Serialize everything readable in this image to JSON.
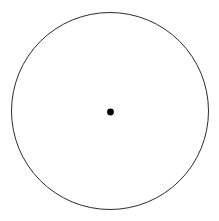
{
  "figure": {
    "title": "Circle with marked center point",
    "canvas": {
      "width": 219,
      "height": 221,
      "background_color": "#ffffff"
    },
    "shapes": {
      "circle_outline": {
        "name": "circle-outline",
        "center_x": 110,
        "center_y": 111,
        "radius": 98.5,
        "stroke_color": "#2b2b2b",
        "stroke_width": 1,
        "fill": "none"
      },
      "center_point": {
        "name": "center-point-dot",
        "center_x": 110.5,
        "center_y": 112,
        "radius": 3.4,
        "fill_color": "#000000",
        "stroke": "none"
      }
    },
    "labels": []
  },
  "chart_data": {
    "type": "scatter",
    "title": "",
    "xlabel": "",
    "ylabel": "",
    "xlim": [
      0,
      219
    ],
    "ylim": [
      0,
      221
    ],
    "grid": false,
    "legend": "none",
    "series": [
      {
        "name": "circle-outline",
        "shape": "circle",
        "cx": 110,
        "cy": 111,
        "r": 98.5,
        "filled": false,
        "color": "#2b2b2b"
      },
      {
        "name": "center-point",
        "shape": "point",
        "x": [
          110.5
        ],
        "y": [
          112
        ],
        "marker_size": 6.8,
        "filled": true,
        "color": "#000000"
      }
    ],
    "annotations": []
  }
}
